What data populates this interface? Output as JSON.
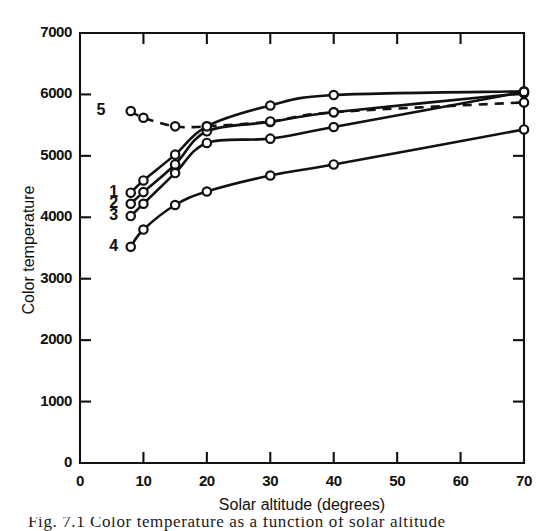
{
  "figure": {
    "caption_partial": "Fig. 7.1   Color temperature as a function of solar altitude"
  },
  "chart_data": {
    "type": "line",
    "title": "",
    "xlabel": "Solar altitude  (degrees)",
    "ylabel": "Color temperature",
    "xlim": [
      0,
      70
    ],
    "ylim": [
      0,
      7000
    ],
    "xticks": [
      0,
      10,
      20,
      30,
      40,
      50,
      60,
      70
    ],
    "xticklabels": [
      "0",
      "10",
      "20",
      "30",
      "40",
      "50",
      "60",
      "70"
    ],
    "yticks": [
      0,
      1000,
      2000,
      3000,
      4000,
      5000,
      6000,
      7000
    ],
    "yticklabels": [
      "0",
      "1000",
      "2000",
      "3000",
      "4000",
      "5000",
      "6000",
      "7000"
    ],
    "grid": false,
    "legend_position": "inline-left-labels",
    "marker": "open-circle",
    "series": [
      {
        "name": "1",
        "label": "1",
        "style": "solid",
        "color": "#111111",
        "label_x": 8,
        "label_y": 4400,
        "x": [
          8,
          10,
          15,
          20,
          30,
          40,
          70
        ],
        "y": [
          4400,
          4600,
          5020,
          5480,
          5820,
          5990,
          6050
        ]
      },
      {
        "name": "2",
        "label": "2",
        "style": "solid",
        "color": "#111111",
        "label_x": 8,
        "label_y": 4220,
        "x": [
          8,
          10,
          15,
          20,
          30,
          40,
          70
        ],
        "y": [
          4220,
          4410,
          4860,
          5400,
          5550,
          5710,
          6020
        ]
      },
      {
        "name": "3",
        "label": "3",
        "style": "solid",
        "color": "#111111",
        "label_x": 8,
        "label_y": 4020,
        "x": [
          8,
          10,
          15,
          20,
          30,
          40,
          70
        ],
        "y": [
          4020,
          4220,
          4720,
          5210,
          5280,
          5470,
          6040
        ]
      },
      {
        "name": "4",
        "label": "4",
        "style": "solid",
        "color": "#111111",
        "label_x": 8,
        "label_y": 3520,
        "x": [
          8,
          10,
          15,
          20,
          30,
          40,
          70
        ],
        "y": [
          3520,
          3800,
          4200,
          4420,
          4680,
          4860,
          5430
        ]
      },
      {
        "name": "5",
        "label": "5",
        "style": "dashed",
        "color": "#111111",
        "label_x": 6,
        "label_y": 5730,
        "x": [
          8,
          10,
          15,
          20,
          30,
          40,
          70
        ],
        "y": [
          5730,
          5620,
          5480,
          5480,
          5560,
          5710,
          5870
        ]
      }
    ]
  }
}
